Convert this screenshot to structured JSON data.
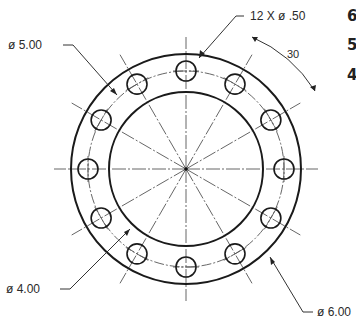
{
  "drawing": {
    "type": "flange-bolt-pattern",
    "center": [
      186,
      169
    ],
    "outer_radius_px": 115,
    "inner_radius_px": 77,
    "bolt_circle_radius_px": 98,
    "hole_radius_px": 10,
    "hole_count": 12,
    "angle_step_deg": 30,
    "centerline_length_px": 132,
    "line_color": "#1a1a1a",
    "centerline_color": "#555555"
  },
  "labels": {
    "holes": "12 X ø .50",
    "angle": "30",
    "bolt_circle": "ø 5.00",
    "inner_diameter": "ø 4.00",
    "outer_diameter": "ø 6.00"
  },
  "side_numbers": [
    "6",
    "5",
    "4"
  ]
}
